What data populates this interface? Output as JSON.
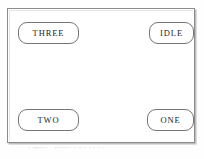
{
  "panel": {
    "title": "",
    "frame_border_color": "#8c8c8c",
    "shadow_color": "#bdbdbd",
    "background_color": "#ffffff",
    "buttons": [
      {
        "name": "three",
        "label": "THREE",
        "corner": "top-left"
      },
      {
        "name": "idle",
        "label": "IDLE",
        "corner": "top-right"
      },
      {
        "name": "two",
        "label": "TWO",
        "corner": "bottom-left"
      },
      {
        "name": "one",
        "label": "ONE",
        "corner": "bottom-right"
      }
    ],
    "display_area": {
      "content": ""
    }
  },
  "caption": {
    "text": "Figure  ‑  panel   l  ti   l  t   i  t  f"
  }
}
